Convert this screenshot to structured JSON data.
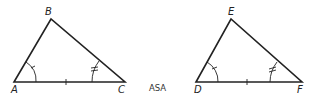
{
  "diagram": {
    "triangle1": {
      "vertices": [
        "A",
        "B",
        "C"
      ]
    },
    "triangle2": {
      "vertices": [
        "D",
        "E",
        "F"
      ]
    },
    "caption": "ASA"
  }
}
